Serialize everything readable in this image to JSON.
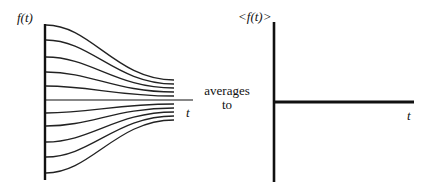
{
  "left_plot": {
    "y_label": "f(t)",
    "x_label": "t",
    "description": "Family of curves starting at different values and converging toward the horizontal axis over time",
    "curve_start_y_px": [
      25,
      40,
      57,
      72,
      86,
      113,
      126,
      142,
      157,
      173
    ],
    "curve_end_y_px": [
      80,
      84,
      88,
      92,
      96,
      104,
      108,
      112,
      116,
      120
    ]
  },
  "connector_text": {
    "line1": "averages",
    "line2": "to"
  },
  "right_plot": {
    "y_label": "<f(t)>",
    "x_label": "t",
    "description": "Average of f(t) is a constant flat line along the horizontal axis"
  },
  "colors": {
    "ink": "#111111",
    "background": "#ffffff"
  }
}
